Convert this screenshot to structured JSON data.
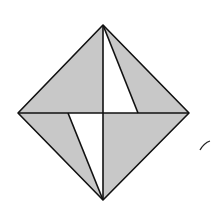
{
  "diagram": {
    "type": "geometric-figure",
    "colors": {
      "shade": "#c8c8c8",
      "stroke": "#111111",
      "background": "#ffffff"
    },
    "vertices": {
      "top": [
        103,
        25
      ],
      "left": [
        18,
        113
      ],
      "right": [
        189,
        113
      ],
      "bottom": [
        103,
        200
      ],
      "center": [
        103,
        113
      ],
      "upper_cut": [
        138,
        113
      ],
      "lower_cut": [
        68,
        113
      ]
    },
    "regions": [
      {
        "name": "upper-left",
        "shaded": true
      },
      {
        "name": "upper-right-outer",
        "shaded": true
      },
      {
        "name": "upper-right-inner",
        "shaded": false
      },
      {
        "name": "lower-right",
        "shaded": true
      },
      {
        "name": "lower-left-outer",
        "shaded": true
      },
      {
        "name": "lower-left-inner",
        "shaded": false
      }
    ]
  }
}
